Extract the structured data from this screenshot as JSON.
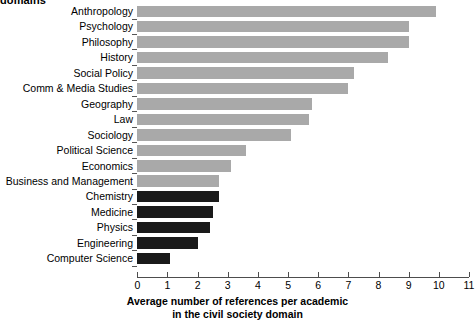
{
  "heading": {
    "clipped_text": "domains"
  },
  "chart_data": {
    "type": "bar",
    "orientation": "horizontal",
    "title": "",
    "xlabel": "Average number of references per academic in the civil society domain",
    "xlabel_line1": "Average number of references per academic",
    "xlabel_line2": "in the civil society domain",
    "ylabel": "",
    "xlim": [
      0,
      11
    ],
    "xticks": [
      0,
      1,
      2,
      3,
      4,
      5,
      6,
      7,
      8,
      9,
      10,
      11
    ],
    "xticklabels": [
      "0",
      "1",
      "2",
      "3",
      "4",
      "5",
      "6",
      "7",
      "8",
      "9",
      "10",
      "11"
    ],
    "grid": false,
    "legend": "none",
    "colors": {
      "light_gray": "#a9a9a9",
      "dark": "#1a1a1a",
      "axis": "#4d4d4d",
      "background": "#ffffff"
    },
    "categories": [
      "Anthropology",
      "Psychology",
      "Philosophy",
      "History",
      "Social Policy",
      "Comm & Media Studies",
      "Geography",
      "Law",
      "Sociology",
      "Political Science",
      "Economics",
      "Business and Management",
      "Chemistry",
      "Medicine",
      "Physics",
      "Engineering",
      "Computer Science"
    ],
    "values": [
      9.9,
      9.0,
      9.0,
      8.3,
      7.2,
      7.0,
      5.8,
      5.7,
      5.1,
      3.6,
      3.1,
      2.7,
      2.7,
      2.5,
      2.4,
      2.0,
      1.1
    ],
    "bar_colors": [
      "light_gray",
      "light_gray",
      "light_gray",
      "light_gray",
      "light_gray",
      "light_gray",
      "light_gray",
      "light_gray",
      "light_gray",
      "light_gray",
      "light_gray",
      "light_gray",
      "dark",
      "dark",
      "dark",
      "dark",
      "dark"
    ]
  }
}
